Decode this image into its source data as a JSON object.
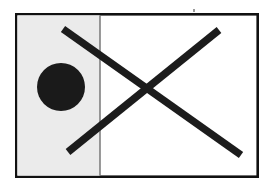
{
  "figure": {
    "title": "Abstract figure: bordered frame with shaded left panel, black disc, and large X",
    "canvas": {
      "width": 274,
      "height": 189,
      "background": "#ffffff"
    },
    "frame": {
      "name": "outer-frame",
      "x": 15,
      "y": 13,
      "width": 244,
      "height": 165,
      "fill": "#ffffff",
      "stroke": "#111111",
      "stroke_width": 2.6
    },
    "panel": {
      "name": "left-shaded-panel",
      "x": 16,
      "y": 14,
      "width": 84,
      "height": 163,
      "fill": "#ebebeb",
      "label": "shaded region"
    },
    "divider": {
      "name": "panel-divider",
      "x1": 100,
      "y1": 14,
      "x2": 100,
      "y2": 177,
      "stroke": "#6f6f6f",
      "stroke_width": 1.4
    },
    "disc": {
      "name": "black-disc",
      "cx": 61,
      "cy": 87,
      "r": 24,
      "fill": "#1a1a1a",
      "label": "filled circle"
    },
    "strokes": [
      {
        "name": "diagonal-stroke-descending",
        "x1": 63,
        "y1": 29,
        "x2": 241,
        "y2": 155,
        "stroke": "#1c1c1c",
        "stroke_width": 7.4,
        "direction": "top-left to bottom-right"
      },
      {
        "name": "diagonal-stroke-ascending",
        "x1": 68,
        "y1": 152,
        "x2": 219,
        "y2": 30,
        "stroke": "#1c1c1c",
        "stroke_width": 7.4,
        "direction": "bottom-left to top-right"
      }
    ],
    "crossing_point": {
      "x": 145,
      "y": 91
    },
    "tick": {
      "name": "top-edge-tick",
      "x": 193,
      "y": 9,
      "width": 2,
      "height": 3,
      "fill": "#9a9a9a"
    }
  }
}
